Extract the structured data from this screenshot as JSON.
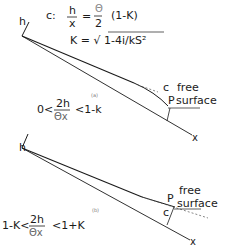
{
  "equations": {
    "c_label": "c:",
    "lhs_num": "h",
    "lhs_den": "x",
    "equals": "=",
    "rhs_num": "Θ",
    "rhs_den": "2",
    "rhs_factor": "(1-K)",
    "k_line": "K = √ 1-4i/kS²"
  },
  "diagram_a": {
    "label": "(a)",
    "axis_h": "h",
    "axis_x": "x",
    "point_c": "c",
    "point_p": "P",
    "free_label_1": "free",
    "free_label_2": "surface",
    "condition_left": "0<",
    "condition_num": "2h",
    "condition_den": "Θx",
    "condition_right": "<1-k"
  },
  "diagram_b": {
    "label": "(b)",
    "axis_h": "h",
    "axis_x": "x",
    "point_c": "c",
    "point_p": "P",
    "free_label_1": "free",
    "free_label_2": "surface",
    "condition_left": "1-K<",
    "condition_num": "2h",
    "condition_den": "Θx",
    "condition_right": "<1+K"
  }
}
